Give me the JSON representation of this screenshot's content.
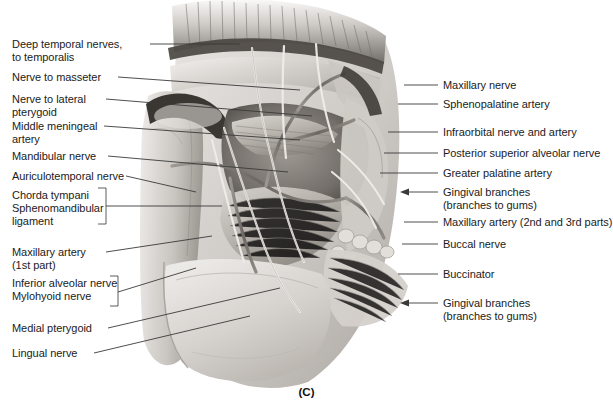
{
  "figure": {
    "caption": "(C)",
    "medium": "grayscale anatomical illustration",
    "colors": {
      "leader_line": "#3a3a3a",
      "text": "#1b1b1b",
      "background": "#ffffff",
      "artwork_light": "#e8e6e3",
      "artwork_mid": "#b5b1ac",
      "artwork_dark": "#4a4642"
    }
  },
  "labels_left": [
    {
      "id": "deep-temporal-nerves",
      "lines": [
        "Deep temporal nerves,",
        "to temporalis"
      ],
      "x": 12,
      "y": 38
    },
    {
      "id": "nerve-to-masseter",
      "lines": [
        "Nerve to masseter"
      ],
      "x": 12,
      "y": 71
    },
    {
      "id": "nerve-to-lateral-pterygoid",
      "lines": [
        "Nerve to lateral",
        "pterygoid"
      ],
      "x": 12,
      "y": 93
    },
    {
      "id": "middle-meningeal-artery",
      "lines": [
        "Middle meningeal",
        "artery"
      ],
      "x": 12,
      "y": 120
    },
    {
      "id": "mandibular-nerve",
      "lines": [
        "Mandibular nerve"
      ],
      "x": 12,
      "y": 150
    },
    {
      "id": "auriculotemporal-nerve",
      "lines": [
        "Auriculotemporal nerve"
      ],
      "x": 12,
      "y": 170
    },
    {
      "id": "chorda-tympani-group",
      "lines": [
        "Chorda tympani",
        "Sphenomandibular",
        "ligament"
      ],
      "x": 12,
      "y": 189
    },
    {
      "id": "maxillary-artery-first-part",
      "lines": [
        "Maxillary artery",
        "(1st part)"
      ],
      "x": 12,
      "y": 246
    },
    {
      "id": "inferior-alveolar-mylohyoid-group",
      "lines": [
        "Inferior alveolar nerve",
        "Mylohyoid nerve"
      ],
      "x": 12,
      "y": 277
    },
    {
      "id": "medial-pterygoid",
      "lines": [
        "Medial pterygoid"
      ],
      "x": 12,
      "y": 322
    },
    {
      "id": "lingual-nerve",
      "lines": [
        "Lingual nerve"
      ],
      "x": 12,
      "y": 347
    }
  ],
  "labels_right": [
    {
      "id": "maxillary-nerve",
      "lines": [
        "Maxillary nerve"
      ],
      "x": 443,
      "y": 79
    },
    {
      "id": "sphenopalatine-artery",
      "lines": [
        "Sphenopalatine artery"
      ],
      "x": 443,
      "y": 98
    },
    {
      "id": "infraorbital-nerve-and-artery",
      "lines": [
        "Infraorbital nerve and artery"
      ],
      "x": 443,
      "y": 126
    },
    {
      "id": "posterior-superior-alveolar-nerve",
      "lines": [
        "Posterior superior alveolar nerve"
      ],
      "x": 443,
      "y": 147
    },
    {
      "id": "greater-palatine-artery",
      "lines": [
        "Greater palatine artery"
      ],
      "x": 443,
      "y": 167
    },
    {
      "id": "gingival-branches-upper",
      "lines": [
        "Gingival branches",
        "(branches to gums)"
      ],
      "x": 443,
      "y": 186
    },
    {
      "id": "maxillary-artery-2nd-3rd-parts",
      "lines": [
        "Maxillary artery (2nd and 3rd parts)"
      ],
      "x": 443,
      "y": 216
    },
    {
      "id": "buccal-nerve",
      "lines": [
        "Buccal nerve"
      ],
      "x": 443,
      "y": 238
    },
    {
      "id": "buccinator",
      "lines": [
        "Buccinator"
      ],
      "x": 443,
      "y": 268
    },
    {
      "id": "gingival-branches-lower",
      "lines": [
        "Gingival branches",
        "(branches to gums)"
      ],
      "x": 443,
      "y": 297
    }
  ]
}
